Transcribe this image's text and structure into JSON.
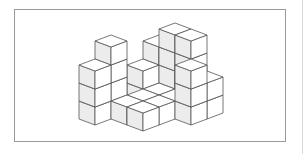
{
  "figure": {
    "type": "isometric-cube-stack",
    "colors": {
      "frame_border": "#9a9a9a",
      "top_face": "#ffffff",
      "left_face": "#ececec",
      "right_face": "#ffffff",
      "edge": "#555555"
    },
    "projection": {
      "origin": [
        79,
        119
      ],
      "axis_a": [
        16,
        6
      ],
      "axis_b": [
        16,
        -6
      ],
      "cube_height": 18
    },
    "cubes": [
      {
        "i": 0,
        "j": 0,
        "h": 3
      },
      {
        "i": 0,
        "j": 1,
        "h": 4
      },
      {
        "i": 0,
        "j": 3,
        "h": 2
      },
      {
        "i": 0,
        "j": 4,
        "h": 3
      },
      {
        "i": 1,
        "j": 1,
        "h": 1
      },
      {
        "i": 1,
        "j": 2,
        "h": 1
      },
      {
        "i": 1,
        "j": 3,
        "h": 1
      },
      {
        "i": 1,
        "j": 4,
        "h": 4
      },
      {
        "i": 2,
        "j": 1,
        "h": 1
      },
      {
        "i": 2,
        "j": 2,
        "h": 1
      },
      {
        "i": 2,
        "j": 3,
        "h": 1
      },
      {
        "i": 2,
        "j": 4,
        "h": 4
      },
      {
        "i": 3,
        "j": 3,
        "h": 3
      },
      {
        "i": 3,
        "j": 4,
        "h": 2
      }
    ]
  }
}
